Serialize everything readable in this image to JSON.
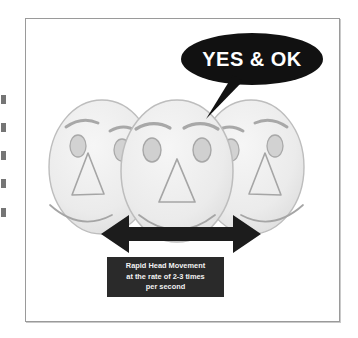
{
  "figure": {
    "background_color": "#ffffff",
    "frame_border_color": "#9a9a9a"
  },
  "speech_bubble": {
    "text": "YES & OK",
    "fill_color": "#111111",
    "text_color": "#ffffff"
  },
  "faces": {
    "count": 3,
    "fill_color": "#ededed",
    "outline_color": "#b4b4b4",
    "items": [
      {
        "label": "head-turned-left",
        "position": "left"
      },
      {
        "label": "head-facing-front",
        "position": "center"
      },
      {
        "label": "head-turned-right",
        "position": "right"
      }
    ],
    "features": [
      "eyebrow",
      "eye",
      "triangular-nose",
      "smile"
    ]
  },
  "arrow": {
    "label": "double-headed-horizontal-arrow",
    "direction": "left-right",
    "color": "#1c1c1c"
  },
  "caption": {
    "background_color": "#2a2a2a",
    "text_color": "#f2f2f2",
    "lines": [
      "Rapid Head Movement",
      "at the rate of 2-3 times",
      "per second"
    ]
  },
  "edge_marks": {
    "label": "scan-edge-artifacts",
    "count": 5,
    "color": "#5d5d5d",
    "tops": [
      95,
      123,
      151,
      179,
      208
    ]
  }
}
